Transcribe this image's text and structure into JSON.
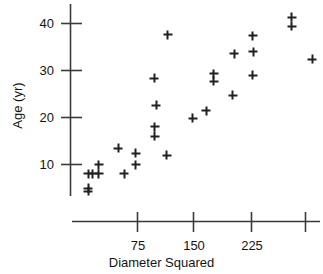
{
  "chart_data": {
    "type": "scatter",
    "title": "",
    "xlabel": "Diameter Squared",
    "ylabel": "Age (yr)",
    "xlim": [
      0,
      320
    ],
    "ylim": [
      0,
      44
    ],
    "grid": false,
    "legend": null,
    "xticks": [
      75,
      150,
      225,
      300
    ],
    "xtick_labels": [
      "75",
      "150",
      "225",
      ""
    ],
    "yticks": [
      10,
      20,
      30,
      40
    ],
    "ytick_labels": [
      "10",
      "20",
      "30",
      "40"
    ],
    "marker": "plus",
    "marker_color": "#202020",
    "axis_color": "#3a3a3a",
    "points": [
      {
        "x": 12,
        "y": 8
      },
      {
        "x": 12,
        "y": 5
      },
      {
        "x": 12,
        "y": 4.3
      },
      {
        "x": 18,
        "y": 8
      },
      {
        "x": 26,
        "y": 10
      },
      {
        "x": 26,
        "y": 8
      },
      {
        "x": 52,
        "y": 13.5
      },
      {
        "x": 60,
        "y": 8
      },
      {
        "x": 75,
        "y": 12.4
      },
      {
        "x": 75,
        "y": 10
      },
      {
        "x": 100,
        "y": 28.3
      },
      {
        "x": 103,
        "y": 22.6
      },
      {
        "x": 101,
        "y": 18
      },
      {
        "x": 101,
        "y": 16
      },
      {
        "x": 118,
        "y": 37.6
      },
      {
        "x": 117,
        "y": 12
      },
      {
        "x": 152,
        "y": 19.8
      },
      {
        "x": 170,
        "y": 21.4
      },
      {
        "x": 180,
        "y": 29.3
      },
      {
        "x": 180,
        "y": 27.7
      },
      {
        "x": 207,
        "y": 33.6
      },
      {
        "x": 205,
        "y": 24.7
      },
      {
        "x": 232,
        "y": 37.4
      },
      {
        "x": 233,
        "y": 34
      },
      {
        "x": 232,
        "y": 29
      },
      {
        "x": 284,
        "y": 41.3
      },
      {
        "x": 284,
        "y": 39.4
      },
      {
        "x": 312,
        "y": 32.4
      }
    ]
  }
}
